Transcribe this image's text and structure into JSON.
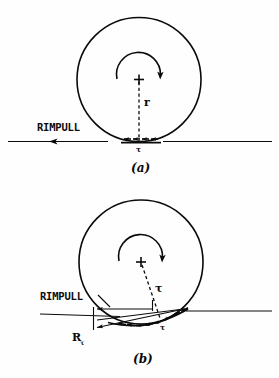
{
  "figure": {
    "panels": [
      {
        "id": "a",
        "caption": "(a)",
        "description": "Rigid wheel on firm surface",
        "labels": {
          "rimpull": "RIMPULL",
          "radius": "r",
          "shear": "τ"
        },
        "geometry": {
          "wheel_center_x": 139,
          "wheel_center_y": 79,
          "wheel_radius": 62,
          "ground_y": 141,
          "ground_x_start": 8,
          "ground_x_end": 272,
          "rimpull_arrow_y": 141,
          "rimpull_arrow_tail_x": 108,
          "rimpull_arrow_head_x": 47,
          "contact_patch_x_start": 122,
          "contact_patch_x_end": 160,
          "shear_arrow_count": 4,
          "rotation_arc_radius": 22,
          "rotation_direction": "clockwise"
        }
      },
      {
        "id": "b",
        "caption": "(b)",
        "description": "Wheel on deformable soil with resultant force",
        "labels": {
          "rimpull": "RIMPULL",
          "resultant": "R",
          "resultant_subscript": "τ",
          "radius": "τ",
          "shear": "τ"
        },
        "geometry": {
          "wheel_center_x": 141,
          "wheel_center_y": 262,
          "wheel_radius": 62,
          "ground_y": 313,
          "ground_x_start": 40,
          "ground_x_end": 272,
          "rimpull_arrow_y": 313,
          "rimpull_arrow_tail_x": 152,
          "rimpull_arrow_head_x": 93,
          "resultant_arrow_tail_x": 183,
          "resultant_arrow_tail_y": 310,
          "resultant_arrow_head_x": 93,
          "resultant_arrow_head_y": 327,
          "contact_patch_x_start": 120,
          "contact_patch_x_end": 185,
          "shear_arrow_count": 7,
          "rotation_arc_radius": 22,
          "rotation_direction": "clockwise"
        }
      }
    ],
    "colors": {
      "ink": "#0a0a0a",
      "background": "#fefefe"
    }
  }
}
